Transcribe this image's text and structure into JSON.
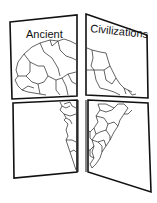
{
  "illustration": {
    "kind": "foldable booklet with map of Africa split across four flaps",
    "title_words": [
      "Ancient",
      "Civilizations"
    ],
    "subject": "Map of Africa",
    "panels": [
      {
        "position": "top-left",
        "content": "Northwest Africa with country borders"
      },
      {
        "position": "top-right",
        "content": "Northeast Africa with country borders"
      },
      {
        "position": "bottom-left",
        "content": "West coast of central/southern Africa"
      },
      {
        "position": "bottom-right",
        "content": "Central and southern Africa with country borders"
      }
    ],
    "colors": {
      "background": "#ffffff",
      "line": "#111111",
      "paper": "#ffffff"
    }
  }
}
